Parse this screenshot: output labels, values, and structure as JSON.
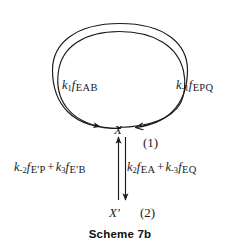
{
  "caption": "Scheme 7b",
  "nodes": {
    "x": "X",
    "x_prime": "X'"
  },
  "step_labels": {
    "step1": "(1)",
    "step2": "(2)"
  },
  "cycle": {
    "forward": {
      "rate_constant": "k",
      "rate_subscript": "1",
      "flux_symbol": "f",
      "species": "EAB",
      "full_text": "k1f EAB"
    },
    "reverse": {
      "rate_constant": "k",
      "rate_subscript": "-1",
      "flux_symbol": "f",
      "species": "EPQ",
      "full_text": "k-1f EPQ"
    }
  },
  "branch": {
    "up": {
      "term1": {
        "rate_constant": "k",
        "rate_subscript": "-2",
        "flux_symbol": "f",
        "species": "E'P"
      },
      "operator": "+",
      "term2": {
        "rate_constant": "k",
        "rate_subscript": "3",
        "flux_symbol": "f",
        "species": "E'B"
      },
      "full_text": "k-2f E'P + k3f E'B"
    },
    "down": {
      "term1": {
        "rate_constant": "k",
        "rate_subscript": "2",
        "flux_symbol": "f",
        "species": "EA"
      },
      "operator": "+",
      "term2": {
        "rate_constant": "k",
        "rate_subscript": "-3",
        "flux_symbol": "f",
        "species": "EQ"
      },
      "full_text": "k2f EA + k-3f EQ"
    }
  },
  "colors": {
    "stroke": "#1a1a1a",
    "background": "#ffffff",
    "text": "#1a1a1a"
  }
}
